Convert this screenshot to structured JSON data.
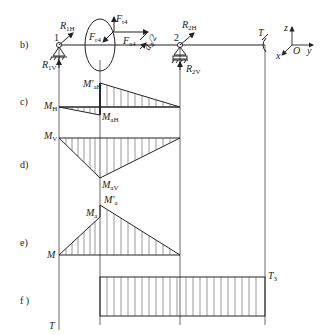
{
  "diagram": {
    "type": "shaft bending and torque moment diagrams",
    "sections": {
      "b": "b)",
      "c": "c)",
      "d": "d)",
      "e": "e)",
      "f": "f )"
    },
    "shaft_labels": {
      "support1": "1",
      "support2": "2",
      "R1H": "R",
      "R1H_sub": "1H",
      "R1V": "R",
      "R1V_sub": "1V",
      "R2H": "R",
      "R2H_sub": "2H",
      "R2V": "R",
      "R2V_sub": "2V",
      "Ft": "F",
      "Ft_sub": "t4",
      "Fr": "F",
      "Fr_sub": "r4",
      "Fa": "F",
      "Fa_sub": "a4",
      "d": "d",
      "d_sub": "4",
      "d_suffix": "/2",
      "T": "T"
    },
    "axes": {
      "z": "z",
      "x": "x",
      "O": "O",
      "y": "y"
    },
    "moment_labels": {
      "MaH_prime": "M'",
      "MaH_prime_sub": "aH",
      "MH": "M",
      "MH_sub": "H",
      "MaH": "M",
      "MaH_sub": "aH",
      "MV": "M",
      "MV_sub": "V",
      "MaV": "M",
      "MaV_sub": "aV",
      "Ma_prime": "M'",
      "Ma_prime_sub": "a",
      "Ma": "M",
      "Ma_sub": "a",
      "M": "M",
      "T3": "T",
      "T3_sub": "3",
      "T": "T"
    },
    "colors": {
      "line": "#222222",
      "hatch": "#555555",
      "background": "#ffffff"
    }
  }
}
